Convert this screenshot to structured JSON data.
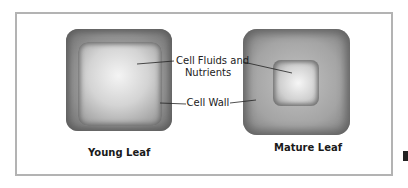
{
  "diagram": {
    "labels": {
      "fluids_line1": "Cell Fluids and",
      "fluids_line2": "Nutrients",
      "wall": "Cell Wall"
    },
    "captions": {
      "young": "Young Leaf",
      "mature": "Mature Leaf"
    },
    "colors": {
      "frame_border": "#b3b3b3",
      "cell_wall_dark": "#6e6e6e",
      "cell_fluid_light": "#f4f4f4",
      "text": "#222222"
    }
  }
}
